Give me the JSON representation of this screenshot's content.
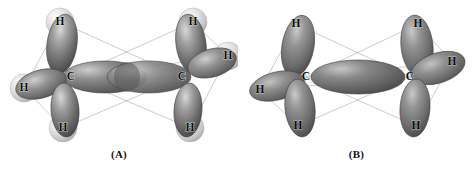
{
  "figure": {
    "background_color": "#ffffff",
    "width": 475,
    "height": 173
  },
  "palette": {
    "lobe_dark": "#4a4a4a",
    "lobe_mid": "#6f6f6f",
    "lobe_light": "#b9b9b9",
    "lobe_highlight": "#d8d8d8",
    "lobe_outline": "#3d3d3d",
    "sphere_light": "#f1f1f1",
    "sphere_mid": "#cfcfcf",
    "sphere_edge": "#9a9a9a",
    "frame_line": "#a9a9a9",
    "label_color": "#0d0d0d"
  },
  "panels": [
    {
      "id": "A",
      "caption": "(A)",
      "has_hydrogen_spheres": true,
      "central_bond": "two-overlapping-lobes",
      "carbons": [
        {
          "label": "C",
          "x": 71,
          "y": 77
        },
        {
          "label": "C",
          "x": 182,
          "y": 77
        }
      ],
      "hydrogens": [
        {
          "label": "H",
          "x": 60,
          "y": 22,
          "sphere": true
        },
        {
          "label": "H",
          "x": 24,
          "y": 88,
          "sphere": true
        },
        {
          "label": "H",
          "x": 63,
          "y": 128,
          "sphere": true
        },
        {
          "label": "H",
          "x": 193,
          "y": 22,
          "sphere": true
        },
        {
          "label": "H",
          "x": 228,
          "y": 56,
          "sphere": true
        },
        {
          "label": "H",
          "x": 190,
          "y": 128,
          "sphere": true
        }
      ]
    },
    {
      "id": "B",
      "caption": "(B)",
      "has_hydrogen_spheres": false,
      "central_bond": "single-central-lobe",
      "carbons": [
        {
          "label": "C",
          "x": 68,
          "y": 77
        },
        {
          "label": "C",
          "x": 172,
          "y": 77
        }
      ],
      "hydrogens": [
        {
          "label": "H",
          "x": 58,
          "y": 24,
          "sphere": false
        },
        {
          "label": "H",
          "x": 22,
          "y": 90,
          "sphere": false
        },
        {
          "label": "H",
          "x": 60,
          "y": 126,
          "sphere": false
        },
        {
          "label": "H",
          "x": 180,
          "y": 24,
          "sphere": false
        },
        {
          "label": "H",
          "x": 214,
          "y": 62,
          "sphere": false
        },
        {
          "label": "H",
          "x": 178,
          "y": 126,
          "sphere": false
        }
      ]
    }
  ]
}
